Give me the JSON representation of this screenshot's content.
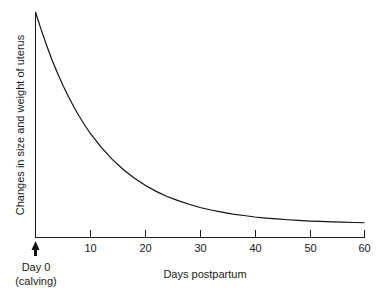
{
  "chart_data": {
    "type": "line",
    "title": "",
    "subtitle": "",
    "xlabel": "Days postpartum",
    "ylabel": "Changes in size and weight of uterus",
    "xlim": [
      0,
      60
    ],
    "ylim": [
      0,
      100
    ],
    "grid": false,
    "legend": null,
    "xticks": [
      10,
      20,
      30,
      40,
      50,
      60
    ],
    "xtick_labels": [
      "10",
      "20",
      "30",
      "40",
      "50",
      "60"
    ],
    "yticks": [],
    "ytick_labels": [],
    "annotations": [
      {
        "name": "day-zero-marker",
        "x": 0,
        "line1": "Day 0",
        "line2": "(calving)",
        "marker": "up-arrow"
      }
    ],
    "series": [
      {
        "name": "Uterine involution",
        "color": "#111111",
        "x": [
          0,
          1,
          2,
          3,
          4,
          5,
          6,
          7,
          8,
          9,
          10,
          12,
          14,
          16,
          18,
          20,
          22,
          24,
          26,
          28,
          30,
          32,
          34,
          36,
          38,
          40,
          42,
          44,
          46,
          48,
          50,
          52,
          54,
          56,
          58,
          60
        ],
        "y": [
          100.0,
          91.9,
          84.4,
          77.5,
          71.2,
          65.4,
          60.1,
          55.2,
          50.7,
          46.6,
          42.7,
          36.1,
          30.5,
          25.7,
          21.7,
          18.3,
          15.4,
          13.0,
          11.0,
          9.3,
          7.8,
          6.6,
          5.6,
          4.7,
          4.0,
          3.3,
          2.8,
          2.4,
          2.0,
          1.7,
          1.4,
          1.2,
          1.0,
          0.9,
          0.7,
          0.6
        ]
      }
    ],
    "curve_model": {
      "form": "exponential decay",
      "equation": "y = 100 * exp(-0.0847 * x)",
      "initial_value": 100,
      "decay_constant": 0.0847
    }
  },
  "axes": {
    "x_title": "Days postpartum",
    "y_title": "Changes in size and weight of uterus",
    "tick_labels": {
      "t10": "10",
      "t20": "20",
      "t30": "30",
      "t40": "40",
      "t50": "50",
      "t60": "60"
    }
  },
  "origin_marker": {
    "line1": "Day 0",
    "line2": "(calving)"
  },
  "colors": {
    "curve": "#111111",
    "axis": "#1a1a1a",
    "text": "#1a1a1a",
    "background": "#ffffff"
  }
}
